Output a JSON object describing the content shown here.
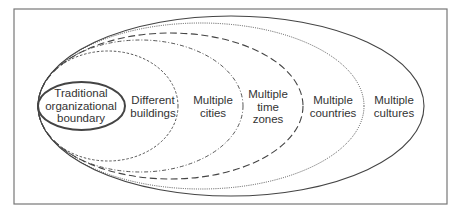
{
  "diagram": {
    "frame": {
      "x": 14,
      "y": 9,
      "width": 433,
      "height": 195,
      "stroke": "#777777"
    },
    "colors": {
      "stroke": "#444444",
      "text": "#333333",
      "background": "#ffffff"
    },
    "ellipses": [
      {
        "id": "cultures",
        "label_lines": [
          "Multiple",
          "cultures"
        ],
        "cx": 231,
        "cy": 106,
        "rx": 193,
        "ry": 90,
        "style": "solid",
        "label_x": 394,
        "label_y": 106
      },
      {
        "id": "countries",
        "label_lines": [
          "Multiple",
          "countries"
        ],
        "cx": 201,
        "cy": 106,
        "rx": 163,
        "ry": 83,
        "style": "dotted",
        "label_x": 333,
        "label_y": 106
      },
      {
        "id": "time-zones",
        "label_lines": [
          "Multiple",
          "time",
          "zones"
        ],
        "cx": 170.5,
        "cy": 106,
        "rx": 132.5,
        "ry": 73,
        "style": "long-dash",
        "label_x": 268,
        "label_y": 107
      },
      {
        "id": "cities",
        "label_lines": [
          "Multiple",
          "cities"
        ],
        "cx": 140.5,
        "cy": 106,
        "rx": 102.5,
        "ry": 66,
        "style": "dash-dot",
        "label_x": 213,
        "label_y": 106
      },
      {
        "id": "buildings",
        "label_lines": [
          "Different",
          "buildings"
        ],
        "cx": 108,
        "cy": 106,
        "rx": 70,
        "ry": 55,
        "style": "short-dash",
        "label_x": 153,
        "label_y": 106
      },
      {
        "id": "traditional",
        "label_lines": [
          "Traditional",
          "organizational",
          "boundary"
        ],
        "cx": 81.5,
        "cy": 106,
        "rx": 43.5,
        "ry": 24,
        "style": "bold-solid",
        "label_x": 81,
        "label_y": 106
      }
    ]
  }
}
